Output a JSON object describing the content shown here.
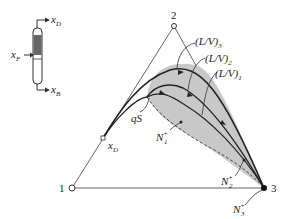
{
  "column": {
    "distillate_label": "x",
    "distillate_sub": "D",
    "feed_label": "x",
    "feed_sub": "F",
    "bottoms_label": "x",
    "bottoms_sub": "B"
  },
  "triangle": {
    "vertex_1": "1",
    "vertex_2": "2",
    "vertex_3": "3",
    "xd_label": "x",
    "xd_sub": "D"
  },
  "curves": {
    "lv3": "(L/V)",
    "lv3_sub": "3",
    "lv2": "(L/V)",
    "lv2_sub": "2",
    "lv1": "(L/V)",
    "lv1_sub": "1",
    "qs": "qS",
    "n1": "N",
    "n1_sub": "1",
    "n2": "N",
    "n2_sub": "2",
    "n3": "N",
    "n3_sub": "3",
    "sup": "+"
  },
  "colors": {
    "shade": "#c8c8c8",
    "line": "#222222",
    "axis": "#555555"
  }
}
